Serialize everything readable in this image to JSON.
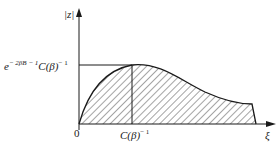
{
  "figure": {
    "y_axis_label": "|z|",
    "x_axis_label": "ξ",
    "origin_label": "0",
    "y_mark_label_base": "e",
    "y_mark_label_exp": "− 2βB − 1",
    "y_mark_label_tail": "C(β)",
    "y_mark_label_tail_exp": "− 1",
    "x_mark_label_base": "C(β)",
    "x_mark_label_exp": "− 1"
  },
  "colors": {
    "ink": "#1a1a1a",
    "background": "#ffffff"
  }
}
